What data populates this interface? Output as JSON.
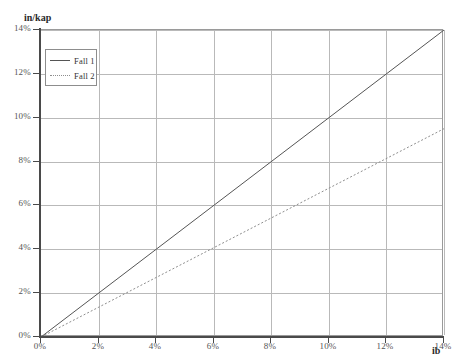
{
  "chart_data": {
    "type": "line",
    "title": "",
    "xlabel": "ib",
    "ylabel": "in/kap",
    "xlim": [
      0,
      14
    ],
    "ylim": [
      0,
      14
    ],
    "grid": true,
    "legend_position": "top-left",
    "x_ticks": [
      "0%",
      "2%",
      "4%",
      "6%",
      "8%",
      "10%",
      "12%",
      "14%"
    ],
    "y_ticks": [
      "0%",
      "2%",
      "4%",
      "6%",
      "8%",
      "10%",
      "12%",
      "14%"
    ],
    "x_tick_values": [
      0,
      2,
      4,
      6,
      8,
      10,
      12,
      14
    ],
    "y_tick_values": [
      0,
      2,
      4,
      6,
      8,
      10,
      12,
      14
    ],
    "series": [
      {
        "name": "Fall 1",
        "style": "solid",
        "color": "#555555",
        "x": [
          0,
          14
        ],
        "values": [
          0,
          14
        ]
      },
      {
        "name": "Fall 2",
        "style": "dotted",
        "color": "#8e8e8e",
        "x": [
          0,
          14
        ],
        "values": [
          0,
          9.5
        ]
      }
    ]
  },
  "axes": {
    "y_title": "in/kap",
    "x_title": "ib"
  },
  "legend": {
    "items": [
      {
        "label": "Fall 1"
      },
      {
        "label": "Fall 2"
      }
    ]
  },
  "colors": {
    "series_1": "#555555",
    "series_2": "#8e8e8e",
    "grid": "#b9b9b9",
    "axis": "#4a4a4a",
    "background": "#ffffff"
  }
}
